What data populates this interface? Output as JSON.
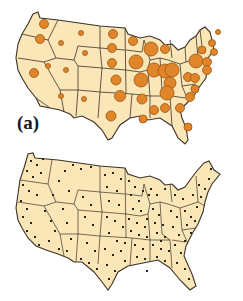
{
  "figure": {
    "panels": [
      {
        "id": "a",
        "label": "(a)",
        "type": "proportional-symbol-map",
        "region": "contiguous United States",
        "symbol": "circle",
        "symbol_color": "#e0852a"
      },
      {
        "id": "b",
        "label": "(b)",
        "type": "dot-map",
        "region": "contiguous United States",
        "symbol": "dot",
        "symbol_color": "#2b2419"
      }
    ]
  },
  "colors": {
    "land": "#fbe6b8",
    "border": "#3a3328",
    "circle_fill": "#e0852a",
    "circle_stroke": "#9a5512",
    "dot": "#2b2419",
    "background": "#ffffff"
  },
  "panel_a": {
    "label": "(a)"
  },
  "panel_b": {
    "label": "(b)"
  }
}
